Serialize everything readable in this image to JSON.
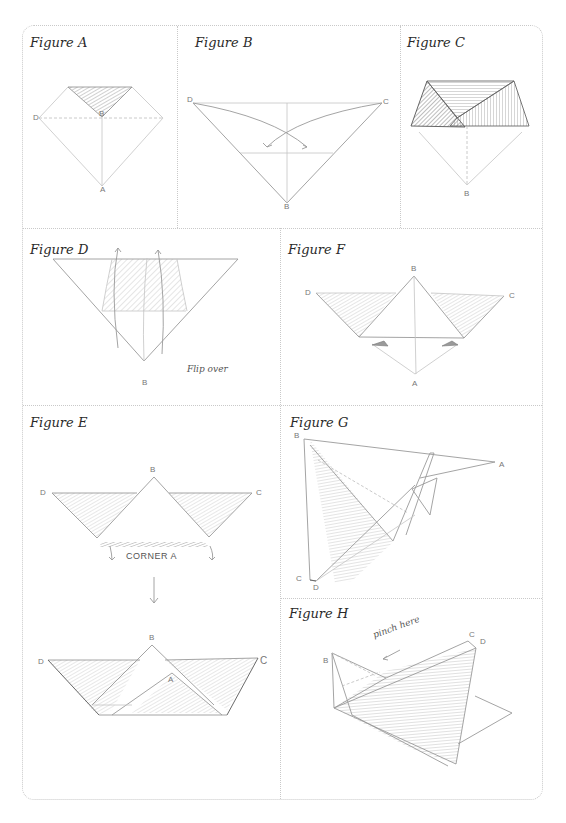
{
  "figures": {
    "a": {
      "title": "Figure A",
      "labels": {
        "left": "D",
        "center": "B",
        "bottom": "A"
      }
    },
    "b": {
      "title": "Figure B",
      "labels": {
        "left": "D",
        "right": "C",
        "bottom": "B"
      }
    },
    "c": {
      "title": "Figure C",
      "labels": {
        "bottom": "B"
      }
    },
    "d": {
      "title": "Figure D",
      "labels": {
        "bottom": "B"
      },
      "note": "Flip over"
    },
    "f": {
      "title": "Figure F",
      "labels": {
        "top": "B",
        "left": "D",
        "right": "C",
        "bottom": "A"
      }
    },
    "e": {
      "title": "Figure E",
      "labels": {
        "top": "B",
        "left": "D",
        "right": "C",
        "top2": "B",
        "left2": "D",
        "right2": "C",
        "inner": "A"
      },
      "note": "CORNER A"
    },
    "g": {
      "title": "Figure G",
      "labels": {
        "top": "B",
        "right": "A",
        "bottom_left": "C",
        "bottom": "D"
      }
    },
    "h": {
      "title": "Figure H",
      "labels": {
        "left": "B",
        "right_c": "C",
        "right_d": "D"
      },
      "note": "pinch here"
    }
  },
  "colors": {
    "border": "#c9c9c9",
    "pencil": "#9a9a9a",
    "text": "#2a2a2a"
  }
}
